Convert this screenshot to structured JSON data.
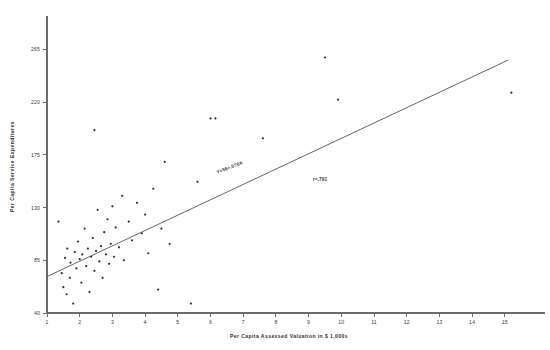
{
  "chart_data": {
    "type": "scatter",
    "title": "",
    "subtitle": "",
    "xlabel": "Per Capita Assessed Valuation in $ 1,000s",
    "ylabel": "Per Capita Service Expenditures",
    "xlim": [
      1,
      15.8
    ],
    "ylim": [
      40,
      290
    ],
    "xticks": [
      1,
      2,
      3,
      4,
      5,
      6,
      7,
      8,
      9,
      10,
      11,
      12,
      13,
      14,
      15
    ],
    "xtick_labels": [
      "1",
      "2",
      "3",
      "4",
      "5",
      "6",
      "7",
      "8",
      "9",
      "10",
      "11",
      "12",
      "13",
      "14",
      "15"
    ],
    "yticks": [
      40,
      85,
      130,
      175,
      220,
      265
    ],
    "ytick_labels": [
      "40",
      "85",
      "130",
      "175",
      "220",
      "265"
    ],
    "grid": false,
    "legend": null,
    "point_color": "#2f2f2f",
    "line_color": "#4a4a4a",
    "axis_color": "#6b6b6b",
    "annotations": [
      {
        "name": "regression-equation",
        "text": "Y=58+.0?0X",
        "x": 6.6,
        "y": 163,
        "rotation": -21
      },
      {
        "name": "correlation-coefficient",
        "text": "r=.791",
        "x": 9.35,
        "y": 153,
        "rotation": 0
      }
    ],
    "regression": {
      "intercept": 58,
      "slope": 13.1,
      "x_start": 1.0,
      "x_end": 15.1,
      "equation_label": "Y=58+.0?0X",
      "r": 0.791
    },
    "points": [
      {
        "x": 1.35,
        "y": 118
      },
      {
        "x": 1.45,
        "y": 74
      },
      {
        "x": 1.5,
        "y": 62
      },
      {
        "x": 1.55,
        "y": 87
      },
      {
        "x": 1.6,
        "y": 56
      },
      {
        "x": 1.62,
        "y": 95
      },
      {
        "x": 1.7,
        "y": 70
      },
      {
        "x": 1.72,
        "y": 83
      },
      {
        "x": 1.8,
        "y": 48
      },
      {
        "x": 1.85,
        "y": 92
      },
      {
        "x": 1.9,
        "y": 78
      },
      {
        "x": 1.95,
        "y": 101
      },
      {
        "x": 2.0,
        "y": 86
      },
      {
        "x": 2.05,
        "y": 66
      },
      {
        "x": 2.08,
        "y": 90
      },
      {
        "x": 2.15,
        "y": 112
      },
      {
        "x": 2.2,
        "y": 80
      },
      {
        "x": 2.25,
        "y": 95
      },
      {
        "x": 2.3,
        "y": 58
      },
      {
        "x": 2.35,
        "y": 88
      },
      {
        "x": 2.4,
        "y": 104
      },
      {
        "x": 2.45,
        "y": 76
      },
      {
        "x": 2.5,
        "y": 93
      },
      {
        "x": 2.55,
        "y": 128
      },
      {
        "x": 2.6,
        "y": 84
      },
      {
        "x": 2.65,
        "y": 97
      },
      {
        "x": 2.7,
        "y": 70
      },
      {
        "x": 2.75,
        "y": 109
      },
      {
        "x": 2.8,
        "y": 90
      },
      {
        "x": 2.85,
        "y": 120
      },
      {
        "x": 2.9,
        "y": 82
      },
      {
        "x": 2.95,
        "y": 99
      },
      {
        "x": 3.0,
        "y": 131
      },
      {
        "x": 3.05,
        "y": 88
      },
      {
        "x": 3.1,
        "y": 113
      },
      {
        "x": 3.2,
        "y": 96
      },
      {
        "x": 3.3,
        "y": 140
      },
      {
        "x": 3.35,
        "y": 85
      },
      {
        "x": 3.5,
        "y": 118
      },
      {
        "x": 3.6,
        "y": 102
      },
      {
        "x": 3.75,
        "y": 134
      },
      {
        "x": 3.9,
        "y": 108
      },
      {
        "x": 4.0,
        "y": 124
      },
      {
        "x": 4.1,
        "y": 91
      },
      {
        "x": 4.25,
        "y": 146
      },
      {
        "x": 4.4,
        "y": 60
      },
      {
        "x": 4.5,
        "y": 112
      },
      {
        "x": 4.6,
        "y": 169
      },
      {
        "x": 4.75,
        "y": 99
      },
      {
        "x": 2.45,
        "y": 196
      },
      {
        "x": 5.4,
        "y": 48
      },
      {
        "x": 5.6,
        "y": 152
      },
      {
        "x": 6.0,
        "y": 206
      },
      {
        "x": 6.15,
        "y": 206
      },
      {
        "x": 7.6,
        "y": 189
      },
      {
        "x": 9.5,
        "y": 258
      },
      {
        "x": 9.9,
        "y": 222
      },
      {
        "x": 15.2,
        "y": 228
      }
    ]
  }
}
